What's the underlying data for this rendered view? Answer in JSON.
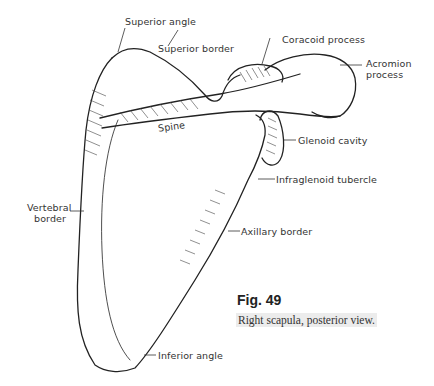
{
  "figure": {
    "number": "Fig.  49",
    "caption": "Right scapula, posterior view."
  },
  "labels": {
    "superior_angle": "Superior angle",
    "superior_border": "Superior border",
    "coracoid_process": "Coracoid process",
    "acromion_process_1": "Acromion",
    "acromion_process_2": "process",
    "spine": "Spine",
    "glenoid_cavity": "Glenoid cavity",
    "infraglenoid_tubercle": "Infraglenoid tubercle",
    "vertebral_border_1": "Vertebral",
    "vertebral_border_2": "border",
    "axillary_border": "Axillary border",
    "inferior_angle": "Inferior angle"
  },
  "colors": {
    "ink": "#222222",
    "label_text": "#333333",
    "caption_highlight": "#ececec"
  }
}
